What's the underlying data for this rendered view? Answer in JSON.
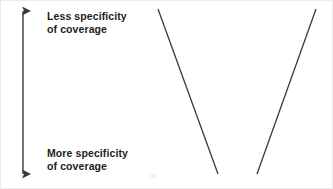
{
  "diagram": {
    "background_color": "#ffffff",
    "stroke_color": "#3a3a3a",
    "text_color": "#1d1d1d",
    "axis": {
      "name": "specificity-axis",
      "orientation": "vertical",
      "arrow_heads": "both",
      "x": 22,
      "top_y": 9,
      "bottom_y": 174,
      "top_label": {
        "line1": "Less specificity",
        "line2": "of coverage"
      },
      "bottom_label": {
        "line1": "More specificity",
        "line2": "of coverage"
      }
    },
    "lines": [
      {
        "name": "left-diagonal",
        "x1": 157,
        "y1": 8,
        "x2": 217,
        "y2": 173
      },
      {
        "name": "right-diagonal",
        "x1": 256,
        "y1": 173,
        "x2": 315,
        "y2": 8
      }
    ]
  }
}
